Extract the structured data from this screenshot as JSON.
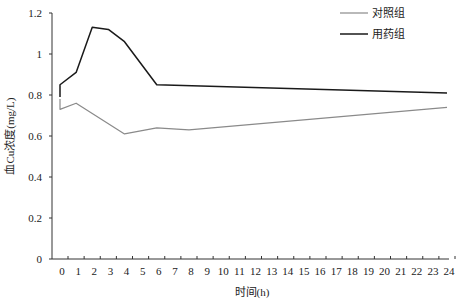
{
  "chart_data": {
    "type": "line",
    "title": "",
    "xlabel": "时间(h)",
    "ylabel": "血Cu浓度(mg/L)",
    "x_ticks": [
      0,
      1,
      2,
      3,
      4,
      5,
      6,
      7,
      8,
      9,
      10,
      11,
      12,
      13,
      14,
      15,
      16,
      17,
      18,
      19,
      20,
      21,
      22,
      23,
      24
    ],
    "y_ticks": [
      0,
      0.2,
      0.4,
      0.6,
      0.8,
      1,
      1.2
    ],
    "y_tick_labels": [
      "0",
      "0.2",
      "0.4",
      "0.6",
      "0.8",
      "1",
      "1.2"
    ],
    "xlim": [
      0,
      24
    ],
    "ylim": [
      0,
      1.2
    ],
    "grid": false,
    "legend_position": "top-right",
    "series": [
      {
        "name": "对照组",
        "color": "#8a8a8a",
        "width": 1.2,
        "x": [
          0,
          0,
          1,
          4,
          6,
          8,
          24
        ],
        "values": [
          0.78,
          0.73,
          0.76,
          0.61,
          0.64,
          0.63,
          0.74
        ]
      },
      {
        "name": "用药组",
        "color": "#1a1a1a",
        "width": 1.5,
        "x": [
          0,
          0,
          1,
          2,
          3,
          4,
          6,
          24
        ],
        "values": [
          0.79,
          0.85,
          0.91,
          1.13,
          1.12,
          1.06,
          0.85,
          0.81
        ]
      }
    ]
  }
}
